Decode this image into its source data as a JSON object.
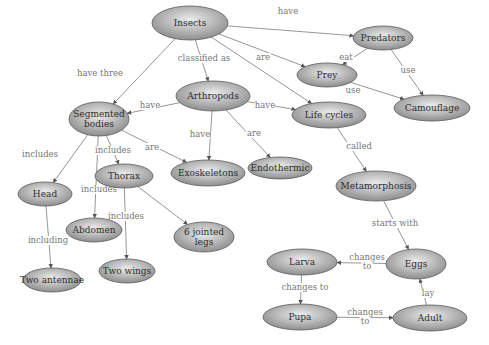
{
  "diagram": {
    "colors": {
      "node_light": "#ececec",
      "node_dark": "#8e8e8e",
      "edge": "#8a8a8a",
      "label": "#777777",
      "text": "#2a2a2a"
    },
    "nodes": [
      {
        "id": "insects",
        "label": [
          "Insects"
        ],
        "cx": 190,
        "cy": 23,
        "rx": 38,
        "ry": 17
      },
      {
        "id": "predators",
        "label": [
          "Predators"
        ],
        "cx": 383,
        "cy": 38,
        "rx": 30,
        "ry": 12
      },
      {
        "id": "prey",
        "label": [
          "Prey"
        ],
        "cx": 327,
        "cy": 75,
        "rx": 30,
        "ry": 12
      },
      {
        "id": "camouflage",
        "label": [
          "Camouflage"
        ],
        "cx": 432,
        "cy": 108,
        "rx": 38,
        "ry": 13
      },
      {
        "id": "arthropods",
        "label": [
          "Arthropods"
        ],
        "cx": 213,
        "cy": 96,
        "rx": 37,
        "ry": 15
      },
      {
        "id": "segmented",
        "label": [
          "Segmented",
          "bodies"
        ],
        "cx": 99,
        "cy": 119,
        "rx": 30,
        "ry": 17
      },
      {
        "id": "lifecycles",
        "label": [
          "Life cycles"
        ],
        "cx": 329,
        "cy": 115,
        "rx": 37,
        "ry": 13
      },
      {
        "id": "exoskeletons",
        "label": [
          "Exoskeletons"
        ],
        "cx": 208,
        "cy": 173,
        "rx": 37,
        "ry": 13
      },
      {
        "id": "endothermic",
        "label": [
          "Endothermic"
        ],
        "cx": 280,
        "cy": 168,
        "rx": 32,
        "ry": 11
      },
      {
        "id": "thorax",
        "label": [
          "Thorax"
        ],
        "cx": 124,
        "cy": 176,
        "rx": 29,
        "ry": 12
      },
      {
        "id": "head",
        "label": [
          "Head"
        ],
        "cx": 45,
        "cy": 194,
        "rx": 27,
        "ry": 12
      },
      {
        "id": "metamorphosis",
        "label": [
          "Metamorphosis"
        ],
        "cx": 376,
        "cy": 186,
        "rx": 40,
        "ry": 15
      },
      {
        "id": "abdomen",
        "label": [
          "Abdomen"
        ],
        "cx": 94,
        "cy": 230,
        "rx": 28,
        "ry": 12
      },
      {
        "id": "legs",
        "label": [
          "6 jointed",
          "legs"
        ],
        "cx": 204,
        "cy": 237,
        "rx": 30,
        "ry": 15
      },
      {
        "id": "wings",
        "label": [
          "Two wings"
        ],
        "cx": 127,
        "cy": 271,
        "rx": 28,
        "ry": 12
      },
      {
        "id": "antennae",
        "label": [
          "Two antennae"
        ],
        "cx": 52,
        "cy": 280,
        "rx": 29,
        "ry": 12
      },
      {
        "id": "eggs",
        "label": [
          "Eggs"
        ],
        "cx": 416,
        "cy": 264,
        "rx": 30,
        "ry": 15
      },
      {
        "id": "larva",
        "label": [
          "Larva"
        ],
        "cx": 302,
        "cy": 262,
        "rx": 35,
        "ry": 13
      },
      {
        "id": "pupa",
        "label": [
          "Pupa"
        ],
        "cx": 300,
        "cy": 317,
        "rx": 37,
        "ry": 13
      },
      {
        "id": "adult",
        "label": [
          "Adult"
        ],
        "cx": 430,
        "cy": 318,
        "rx": 37,
        "ry": 13
      }
    ],
    "edges": [
      {
        "from": "insects",
        "to": "predators",
        "label": [
          "have"
        ],
        "lx": 288,
        "ly": 14
      },
      {
        "from": "insects",
        "to": "prey",
        "label": [
          "are"
        ],
        "lx": 263,
        "ly": 60
      },
      {
        "from": "insects",
        "to": "lifecycles",
        "label": [],
        "lx": 0,
        "ly": 0
      },
      {
        "from": "insects",
        "to": "arthropods",
        "label": [
          "classified as"
        ],
        "lx": 204,
        "ly": 61
      },
      {
        "from": "insects",
        "to": "segmented",
        "label": [
          "have three"
        ],
        "lx": 100,
        "ly": 76
      },
      {
        "from": "predators",
        "to": "prey",
        "label": [
          "eat"
        ],
        "lx": 346,
        "ly": 60
      },
      {
        "from": "predators",
        "to": "camouflage",
        "label": [
          "use"
        ],
        "lx": 408,
        "ly": 73
      },
      {
        "from": "prey",
        "to": "camouflage",
        "label": [
          "use"
        ],
        "lx": 353,
        "ly": 93
      },
      {
        "from": "arthropods",
        "to": "segmented",
        "label": [
          "have"
        ],
        "lx": 150,
        "ly": 108
      },
      {
        "from": "arthropods",
        "to": "exoskeletons",
        "label": [
          "have"
        ],
        "lx": 200,
        "ly": 137
      },
      {
        "from": "arthropods",
        "to": "endothermic",
        "label": [
          "are"
        ],
        "lx": 254,
        "ly": 136
      },
      {
        "from": "arthropods",
        "to": "lifecycles",
        "label": [
          "have"
        ],
        "lx": 265,
        "ly": 108
      },
      {
        "from": "segmented",
        "to": "exoskeletons",
        "label": [
          "are"
        ],
        "lx": 152,
        "ly": 150
      },
      {
        "from": "segmented",
        "to": "head",
        "label": [
          "includes"
        ],
        "lx": 40,
        "ly": 157
      },
      {
        "from": "segmented",
        "to": "abdomen",
        "label": [
          "includes"
        ],
        "lx": 99,
        "ly": 192
      },
      {
        "from": "segmented",
        "to": "thorax",
        "label": [
          "includes"
        ],
        "lx": 113,
        "ly": 153
      },
      {
        "from": "thorax",
        "to": "wings",
        "label": [
          "includes"
        ],
        "lx": 126,
        "ly": 219
      },
      {
        "from": "thorax",
        "to": "legs",
        "label": [],
        "lx": 0,
        "ly": 0
      },
      {
        "from": "head",
        "to": "antennae",
        "label": [
          "including"
        ],
        "lx": 48,
        "ly": 243
      },
      {
        "from": "lifecycles",
        "to": "metamorphosis",
        "label": [
          "called"
        ],
        "lx": 359,
        "ly": 149
      },
      {
        "from": "metamorphosis",
        "to": "eggs",
        "label": [
          "starts with"
        ],
        "lx": 395,
        "ly": 226
      },
      {
        "from": "eggs",
        "to": "larva",
        "label": [
          "changes",
          "to"
        ],
        "lx": 367,
        "ly": 264
      },
      {
        "from": "larva",
        "to": "pupa",
        "label": [
          "changes to"
        ],
        "lx": 305,
        "ly": 290
      },
      {
        "from": "pupa",
        "to": "adult",
        "label": [
          "changes",
          "to"
        ],
        "lx": 365,
        "ly": 319
      },
      {
        "from": "adult",
        "to": "eggs",
        "label": [
          "lay"
        ],
        "lx": 428,
        "ly": 296
      }
    ]
  }
}
